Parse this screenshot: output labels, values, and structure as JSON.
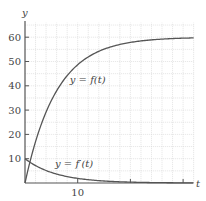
{
  "chart_data": {
    "type": "line",
    "title": "",
    "xlabel": "t",
    "ylabel": "y",
    "xlim": [
      0,
      32
    ],
    "ylim": [
      0,
      66
    ],
    "grid": true,
    "grid_spacing": {
      "x": 2,
      "y": 5
    },
    "x_ticks": [
      10,
      20,
      30
    ],
    "x_tick_labels": [
      "10",
      "",
      ""
    ],
    "y_ticks": [
      10,
      20,
      30,
      40,
      50,
      60
    ],
    "y_tick_labels": [
      "10",
      "20",
      "30",
      "40",
      "50",
      "60"
    ],
    "series": [
      {
        "name": "y = f(t)",
        "formula": "60(1 - e^(-t/6))",
        "x": [
          0,
          1,
          2,
          3,
          4,
          5,
          6,
          8,
          10,
          12,
          14,
          16,
          18,
          20,
          22,
          24,
          26,
          28,
          30,
          32
        ],
        "values": [
          0,
          9.2,
          17.0,
          23.6,
          29.2,
          34.1,
          37.9,
          44.2,
          48.7,
          51.9,
          54.2,
          55.8,
          57.0,
          57.9,
          58.5,
          58.9,
          59.2,
          59.4,
          59.6,
          59.7
        ]
      },
      {
        "name": "y = f'(t)",
        "formula": "10 e^(-t/6)",
        "x": [
          0,
          1,
          2,
          3,
          4,
          5,
          6,
          8,
          10,
          12,
          14,
          16,
          18,
          20,
          22,
          24,
          26,
          28,
          30,
          32
        ],
        "values": [
          10,
          8.5,
          7.2,
          6.1,
          5.1,
          4.3,
          3.7,
          2.6,
          1.9,
          1.4,
          1.0,
          0.7,
          0.5,
          0.4,
          0.3,
          0.2,
          0.1,
          0.1,
          0.1,
          0.05
        ]
      }
    ],
    "annotations": [
      {
        "text": "y = f(t)",
        "at": [
          8.5,
          41
        ]
      },
      {
        "text": "y = f′(t)",
        "at": [
          5.7,
          6.5
        ]
      }
    ]
  }
}
